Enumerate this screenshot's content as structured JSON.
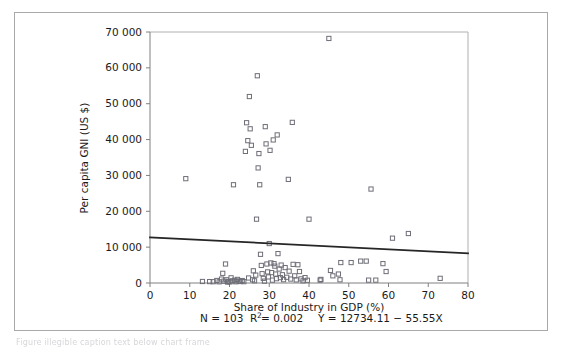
{
  "chart_data": {
    "type": "scatter",
    "title": "",
    "xlabel": "Share of Industry in GDP (%)",
    "ylabel": "Per capita GNI (US $)",
    "xlim": [
      0,
      80
    ],
    "ylim": [
      0,
      70000
    ],
    "xticks": [
      0,
      10,
      20,
      30,
      40,
      50,
      60,
      70,
      80
    ],
    "xtick_labels": [
      "0",
      "10",
      "20",
      "30",
      "40",
      "50",
      "60",
      "70",
      "80"
    ],
    "yticks": [
      0,
      10000,
      20000,
      30000,
      40000,
      50000,
      60000,
      70000
    ],
    "ytick_labels": [
      "0",
      "10 000",
      "20 000",
      "30 000",
      "40 000",
      "50 000",
      "60 000",
      "70 000"
    ],
    "grid": false,
    "legend": "none",
    "marker_style": "open-square",
    "marker_color": "#6e6e78",
    "trendline": {
      "type": "linear",
      "intercept": 12734.11,
      "slope": -55.55,
      "x_start": 0,
      "x_end": 80,
      "y_start": 12734.11,
      "y_end": 8290.11,
      "color": "#262626"
    },
    "stats": {
      "n_label": "N = 103",
      "n_value": 103,
      "r2_label": "R",
      "r2_sup": "2",
      "r2_value_label": " = 0.002",
      "r2_value": 0.002,
      "equation_label": "Y = 12734.11 − 55.55X",
      "full_line": "N = 103    R2 = 0.002    Y = 12734.11 − 55.55X"
    },
    "points": [
      [
        9.0,
        29100
      ],
      [
        13.2,
        420
      ],
      [
        15.0,
        390
      ],
      [
        15.9,
        360
      ],
      [
        16.8,
        700
      ],
      [
        17.4,
        330
      ],
      [
        18.0,
        1100
      ],
      [
        18.3,
        2700
      ],
      [
        18.6,
        520
      ],
      [
        19.0,
        5300
      ],
      [
        19.2,
        900
      ],
      [
        19.5,
        260
      ],
      [
        19.8,
        430
      ],
      [
        20.1,
        300
      ],
      [
        20.4,
        1450
      ],
      [
        20.7,
        610
      ],
      [
        21.0,
        27400
      ],
      [
        21.3,
        780
      ],
      [
        21.6,
        340
      ],
      [
        22.0,
        1000
      ],
      [
        22.4,
        560
      ],
      [
        22.8,
        420
      ],
      [
        23.2,
        690
      ],
      [
        23.6,
        380
      ],
      [
        24.0,
        36700
      ],
      [
        24.3,
        44700
      ],
      [
        24.6,
        39700
      ],
      [
        24.8,
        1400
      ],
      [
        25.0,
        52000
      ],
      [
        25.2,
        43000
      ],
      [
        25.5,
        38400
      ],
      [
        25.8,
        900
      ],
      [
        26.0,
        3400
      ],
      [
        26.3,
        620
      ],
      [
        26.6,
        2200
      ],
      [
        26.8,
        17800
      ],
      [
        27.0,
        57800
      ],
      [
        27.2,
        32100
      ],
      [
        27.4,
        36100
      ],
      [
        27.6,
        27400
      ],
      [
        27.8,
        8000
      ],
      [
        28.0,
        4900
      ],
      [
        28.2,
        2600
      ],
      [
        28.5,
        1300
      ],
      [
        28.8,
        520
      ],
      [
        29.0,
        43600
      ],
      [
        29.2,
        38800
      ],
      [
        29.4,
        5300
      ],
      [
        29.6,
        3100
      ],
      [
        29.8,
        1700
      ],
      [
        30.0,
        11000
      ],
      [
        30.2,
        37000
      ],
      [
        30.4,
        5600
      ],
      [
        30.6,
        2900
      ],
      [
        30.8,
        800
      ],
      [
        31.0,
        39900
      ],
      [
        31.2,
        5400
      ],
      [
        31.4,
        4700
      ],
      [
        31.6,
        2500
      ],
      [
        31.8,
        1200
      ],
      [
        32.0,
        41300
      ],
      [
        32.2,
        8200
      ],
      [
        32.5,
        3900
      ],
      [
        32.8,
        1500
      ],
      [
        33.0,
        5000
      ],
      [
        33.3,
        2300
      ],
      [
        33.6,
        930
      ],
      [
        34.0,
        4300
      ],
      [
        34.4,
        1600
      ],
      [
        34.8,
        28900
      ],
      [
        35.0,
        3300
      ],
      [
        35.4,
        1100
      ],
      [
        35.8,
        44800
      ],
      [
        36.0,
        5200
      ],
      [
        36.4,
        2000
      ],
      [
        36.8,
        870
      ],
      [
        37.2,
        5100
      ],
      [
        37.6,
        3200
      ],
      [
        38.0,
        1150
      ],
      [
        38.5,
        610
      ],
      [
        39.0,
        1500
      ],
      [
        39.6,
        760
      ],
      [
        40.0,
        17800
      ],
      [
        42.8,
        800
      ],
      [
        43.0,
        1000
      ],
      [
        45.0,
        68200
      ],
      [
        45.4,
        3500
      ],
      [
        46.0,
        2000
      ],
      [
        47.4,
        2500
      ],
      [
        47.8,
        900
      ],
      [
        48.0,
        5700
      ],
      [
        50.6,
        5700
      ],
      [
        53.0,
        6100
      ],
      [
        54.4,
        6100
      ],
      [
        55.0,
        800
      ],
      [
        55.6,
        26200
      ],
      [
        56.8,
        800
      ],
      [
        58.6,
        5400
      ],
      [
        59.4,
        3200
      ],
      [
        61.0,
        12500
      ],
      [
        65.0,
        13800
      ],
      [
        73.0,
        1300
      ]
    ]
  },
  "caption": {
    "text": "Figure illegible caption text below chart frame"
  }
}
